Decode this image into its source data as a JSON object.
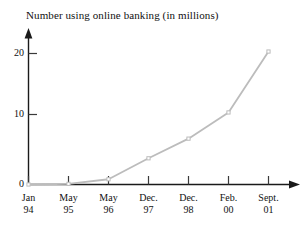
{
  "chart_data": {
    "type": "line",
    "title": "Number using online banking (in millions)",
    "xlabel": "",
    "ylabel": "",
    "ylim": [
      0,
      23
    ],
    "yticks": [
      0,
      10,
      20
    ],
    "ytick_labels": [
      "0",
      "10",
      "20"
    ],
    "grid": false,
    "legend": null,
    "marker": "square",
    "line_color": "#bcbcbc",
    "axis_color": "#1a1a1a",
    "categories": [
      "Jan 94",
      "May 95",
      "May 96",
      "Dec. 97",
      "Dec. 98",
      "Feb. 00",
      "Sept. 01"
    ],
    "category_lines": [
      {
        "top": "Jan",
        "bottom": "94"
      },
      {
        "top": "May",
        "bottom": "95"
      },
      {
        "top": "May",
        "bottom": "96"
      },
      {
        "top": "Dec.",
        "bottom": "97"
      },
      {
        "top": "Dec.",
        "bottom": "98"
      },
      {
        "top": "Feb.",
        "bottom": "00"
      },
      {
        "top": "Sept.",
        "bottom": "01"
      }
    ],
    "values": [
      0,
      0.1,
      0.8,
      4,
      7,
      11,
      20.3
    ]
  }
}
